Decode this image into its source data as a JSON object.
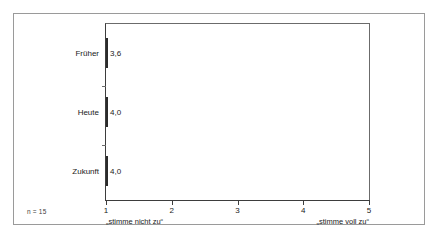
{
  "chart_data": {
    "type": "bar",
    "orientation": "horizontal",
    "title": "",
    "xlabel": "",
    "ylabel": "",
    "categories": [
      "Früher",
      "Heute",
      "Zukunft"
    ],
    "values": [
      3.6,
      4.0,
      4.0
    ],
    "value_labels": [
      "3,6",
      "4,0",
      "4,0"
    ],
    "bar_colors": [
      "#c9c9c9",
      "#808080",
      "#3f3f3f"
    ],
    "bar_border_color": "#2b2b2b",
    "xlim": [
      1,
      5
    ],
    "xticks": [
      1,
      2,
      3,
      4,
      5
    ],
    "xtick_labels": [
      "1",
      "2",
      "3",
      "4",
      "5"
    ],
    "grid": false,
    "legend": false,
    "baseline": 1,
    "scale_anchor_low": "„stimme nicht zu“",
    "scale_anchor_high": "„stimme voll zu“",
    "sample_size_note": "n = 15"
  }
}
